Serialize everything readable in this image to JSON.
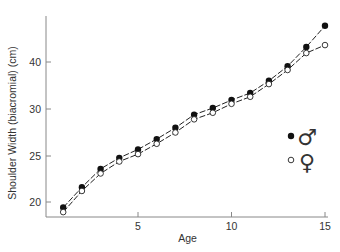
{
  "chart_data": {
    "type": "line",
    "title": "",
    "xlabel": "Age",
    "ylabel": "Shoulder Width (biacromial) (cm)",
    "x": [
      1,
      2,
      3,
      4,
      5,
      6,
      7,
      8,
      9,
      10,
      11,
      12,
      13,
      14,
      15
    ],
    "x_ticks": [
      5,
      10,
      15
    ],
    "y_ticks": [
      20,
      25,
      30,
      40
    ],
    "y_ticks_px": [
      202,
      156,
      109,
      62
    ],
    "xlim": [
      0.2,
      15.4
    ],
    "grid": false,
    "legend_position": "right",
    "series": [
      {
        "name": "Male",
        "symbol": "♂",
        "marker": "filled-circle",
        "line": "dashed",
        "values": [
          19.4,
          21.6,
          23.6,
          24.8,
          25.7,
          26.8,
          28.0,
          29.4,
          30.2,
          31.9,
          33.4,
          36.0,
          39.1,
          43.2,
          47.7
        ]
      },
      {
        "name": "Female",
        "symbol": "♀",
        "marker": "open-circle",
        "line": "dashed",
        "values": [
          18.9,
          21.2,
          23.1,
          24.4,
          25.2,
          26.3,
          27.5,
          28.9,
          29.6,
          31.1,
          32.6,
          35.3,
          38.3,
          41.9,
          43.6
        ]
      }
    ]
  },
  "legend": {
    "male_symbol": "♂",
    "female_symbol": "♀"
  },
  "colors": {
    "axis": "#888888",
    "line": "#222222",
    "marker_fill": "#111111"
  }
}
